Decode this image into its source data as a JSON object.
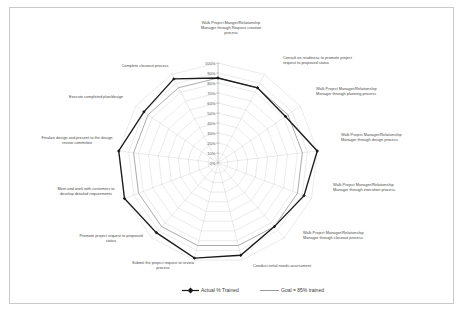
{
  "chart_data": {
    "type": "radar",
    "title": "",
    "xlabel": "",
    "ylabel": "",
    "ylim": [
      0,
      100
    ],
    "grid": true,
    "legend_position": "bottom",
    "tick_labels": [
      "0%",
      "10%",
      "20%",
      "30%",
      "40%",
      "50%",
      "60%",
      "70%",
      "80%",
      "90%",
      "100%"
    ],
    "tick_values": [
      0,
      10,
      20,
      30,
      40,
      50,
      60,
      70,
      80,
      90,
      100
    ],
    "categories": [
      "Walk Project Manger/Relationship Manager through Request creation process",
      "Consult on readiness to promote project request to proposed status",
      "Walk Project Manager/Relationship Manager through planning process",
      "Walk Project Manager/Relationship Manager through design process",
      "Walk Project Manager/Relationship Manager through execution process",
      "Walk Project Manager/Relationship Manager through closeout process",
      "Conduct initial needs assessment",
      "Submit the project request to review process",
      "Promote project request to proposed status",
      "Meet and work with customers to develop detailed requirements",
      "Finalize design and present to the design review committee",
      "Execute completed plan/design",
      "Complete closeout process"
    ],
    "series": [
      {
        "name": "Actual % Trained",
        "color": "#1a1a1a",
        "marker": true,
        "values": [
          85,
          85,
          82,
          100,
          92,
          85,
          95,
          98,
          93,
          100,
          100,
          90,
          95
        ]
      },
      {
        "name": "Goal = 85% trained",
        "color": "#8f8f8f",
        "marker": false,
        "values": [
          85,
          85,
          85,
          85,
          85,
          85,
          85,
          85,
          85,
          85,
          85,
          85,
          85
        ]
      }
    ]
  },
  "legend": {
    "items": [
      {
        "label": "Actual % Trained",
        "marker": "line-with-diamond-marker"
      },
      {
        "label": "Goal = 85% trained",
        "marker": "plain-line"
      }
    ]
  },
  "axis_labels": [
    {
      "lines": [
        "Walk Project Manger/Relationship",
        "Manager through Request creation",
        "process"
      ],
      "anchor": "middle",
      "x": 231,
      "y": 24
    },
    {
      "lines": [
        "Consult on readiness to promote project",
        "request to proposed status"
      ],
      "anchor": "start",
      "x": 283,
      "y": 59
    },
    {
      "lines": [
        "Walk Project Manager/Relationship",
        "Manager through planning process"
      ],
      "anchor": "start",
      "x": 316,
      "y": 90
    },
    {
      "lines": [
        "Walk Project Manager/Relationship",
        "Manager through design process"
      ],
      "anchor": "start",
      "x": 341,
      "y": 136
    },
    {
      "lines": [
        "Walk Project Manager/Relationship",
        "Manager through execution process"
      ],
      "anchor": "start",
      "x": 333,
      "y": 186
    },
    {
      "lines": [
        "Walk Project Manager/Relationship",
        "Manager through closeout process"
      ],
      "anchor": "start",
      "x": 303,
      "y": 234
    },
    {
      "lines": [
        "Conduct initial needs assessment"
      ],
      "anchor": "start",
      "x": 253,
      "y": 267
    },
    {
      "lines": [
        "Submit the project request to review",
        "process"
      ],
      "anchor": "middle",
      "x": 163,
      "y": 264
    },
    {
      "lines": [
        "Promote project request to proposed",
        "status"
      ],
      "anchor": "middle",
      "x": 111,
      "y": 237
    },
    {
      "lines": [
        "Meet and work with customers to",
        "develop detailed requirements"
      ],
      "anchor": "middle",
      "x": 86,
      "y": 190
    },
    {
      "lines": [
        "Finalize design and present to the design",
        "review committee"
      ],
      "anchor": "middle",
      "x": 77,
      "y": 139
    },
    {
      "lines": [
        "Execute completed plan/design"
      ],
      "anchor": "middle",
      "x": 96,
      "y": 98
    },
    {
      "lines": [
        "Complete closeout process"
      ],
      "anchor": "middle",
      "x": 145,
      "y": 67
    }
  ],
  "geometry": {
    "cx": 218,
    "cy": 163,
    "radius": 100,
    "rings": 10,
    "axes": 13,
    "start_angle_deg": -90
  },
  "colors": {
    "actual": "#1a1a1a",
    "goal": "#8f8f8f",
    "grid": "#c6c6c6",
    "frame": "#c9c9c9",
    "text": "#4a4a4a",
    "background": "#ffffff"
  }
}
